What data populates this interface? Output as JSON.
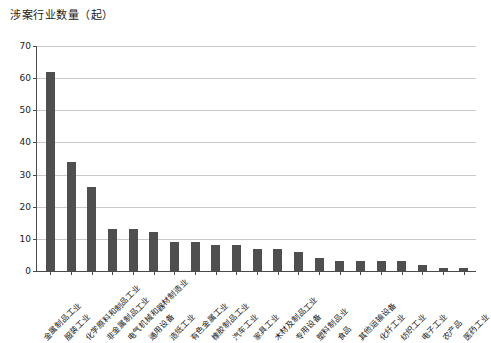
{
  "chart_data": {
    "type": "bar",
    "title": "涉案行业数量（起）",
    "xlabel": "",
    "ylabel": "",
    "ylim": [
      0,
      70
    ],
    "yticks": [
      0,
      10,
      20,
      30,
      40,
      50,
      60,
      70
    ],
    "grid": true,
    "legend": false,
    "bar_color": "#4f4f4f",
    "categories": [
      "金属制品工业",
      "服装工业",
      "化学原料和制品工业",
      "非金属制品工业",
      "电气机械和器材制造业",
      "通用设备",
      "造纸工业",
      "有色金属工业",
      "橡胶制品工业",
      "汽车工业",
      "家具工业",
      "木材及制品工业",
      "专用设备",
      "塑料制品业",
      "食品",
      "其他运输设备",
      "化纤工业",
      "纺织工业",
      "电子工业",
      "农产品",
      "医药工业"
    ],
    "values": [
      62,
      34,
      26,
      13,
      13,
      12,
      9,
      9,
      8,
      8,
      7,
      7,
      6,
      4,
      3,
      3,
      3,
      3,
      2,
      1,
      1
    ]
  }
}
